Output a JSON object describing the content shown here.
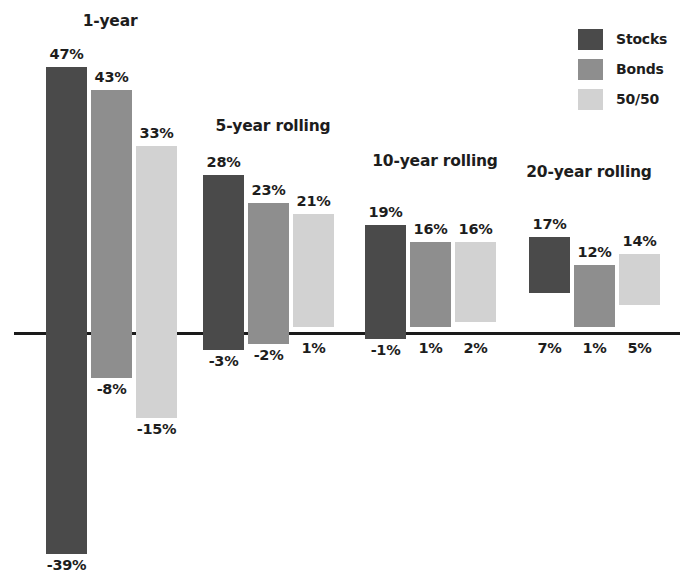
{
  "chart_data": {
    "type": "bar",
    "title": "",
    "subtitle": "",
    "xlabel": "",
    "ylabel": "",
    "orientation": "vertical",
    "grid": false,
    "legend_position": "top-right",
    "axis": {
      "zero_line": true,
      "ylim": [
        -42,
        50
      ],
      "units": "percent"
    },
    "categories": [
      "1-year",
      "5-year rolling",
      "10-year rolling",
      "20-year rolling"
    ],
    "series": [
      {
        "name": "Stocks",
        "color": "#4a4a4a",
        "high": [
          47,
          28,
          19,
          17
        ],
        "low": [
          -39,
          -3,
          -1,
          7
        ],
        "high_labels": [
          "47%",
          "28%",
          "19%",
          "17%"
        ],
        "low_labels": [
          "-39%",
          "-3%",
          "-1%",
          "7%"
        ]
      },
      {
        "name": "Bonds",
        "color": "#8e8e8e",
        "high": [
          43,
          23,
          16,
          12
        ],
        "low": [
          -8,
          -2,
          1,
          1
        ],
        "high_labels": [
          "43%",
          "23%",
          "16%",
          "12%"
        ],
        "low_labels": [
          "-8%",
          "-2%",
          "1%",
          "1%"
        ]
      },
      {
        "name": "50/50",
        "color": "#d2d2d2",
        "high": [
          33,
          21,
          16,
          14
        ],
        "low": [
          -15,
          1,
          2,
          5
        ],
        "high_labels": [
          "33%",
          "21%",
          "16%",
          "14%"
        ],
        "low_labels": [
          "-15%",
          "1%",
          "2%",
          "5%"
        ]
      }
    ]
  },
  "legend": {
    "items": [
      {
        "label": "Stocks",
        "color": "#4a4a4a"
      },
      {
        "label": "Bonds",
        "color": "#8e8e8e"
      },
      {
        "label": "50/50",
        "color": "#d2d2d2"
      }
    ]
  },
  "groups": [
    {
      "title": "1-year",
      "title_x": 110,
      "title_y": 12,
      "bars": [
        {
          "series": "Stocks",
          "x": 46,
          "top_label": "47%",
          "bottom_label": "-39%",
          "top_value": 47,
          "bottom_value": -39
        },
        {
          "series": "Bonds",
          "x": 91,
          "top_label": "43%",
          "bottom_label": "-8%",
          "top_value": 43,
          "bottom_value": -8
        },
        {
          "series": "50/50",
          "x": 136,
          "top_label": "33%",
          "bottom_label": "-15%",
          "top_value": 33,
          "bottom_value": -15
        }
      ]
    },
    {
      "title": "5-year rolling",
      "title_x": 273,
      "title_y": 117,
      "bars": [
        {
          "series": "Stocks",
          "x": 203,
          "top_label": "28%",
          "bottom_label": "-3%",
          "top_value": 28,
          "bottom_value": -3
        },
        {
          "series": "Bonds",
          "x": 248,
          "top_label": "23%",
          "bottom_label": "-2%",
          "top_value": 23,
          "bottom_value": -2
        },
        {
          "series": "50/50",
          "x": 293,
          "top_label": "21%",
          "bottom_label": "1%",
          "top_value": 21,
          "bottom_value": 1
        }
      ]
    },
    {
      "title": "10-year rolling",
      "title_x": 435,
      "title_y": 152,
      "bars": [
        {
          "series": "Stocks",
          "x": 365,
          "top_label": "19%",
          "bottom_label": "-1%",
          "top_value": 19,
          "bottom_value": -1
        },
        {
          "series": "Bonds",
          "x": 410,
          "top_label": "16%",
          "bottom_label": "1%",
          "top_value": 16,
          "bottom_value": 1
        },
        {
          "series": "50/50",
          "x": 455,
          "top_label": "16%",
          "bottom_label": "2%",
          "top_value": 16,
          "bottom_value": 2
        }
      ]
    },
    {
      "title": "20-year rolling",
      "title_x": 589,
      "title_y": 163,
      "bars": [
        {
          "series": "Stocks",
          "x": 529,
          "top_label": "17%",
          "bottom_label": "7%",
          "top_value": 17,
          "bottom_value": 7
        },
        {
          "series": "Bonds",
          "x": 574,
          "top_label": "12%",
          "bottom_label": "1%",
          "top_value": 12,
          "bottom_value": 1
        },
        {
          "series": "50/50",
          "x": 619,
          "top_label": "14%",
          "bottom_label": "5%",
          "top_value": 14,
          "bottom_value": 5
        }
      ]
    }
  ],
  "scale": {
    "zero_y": 333,
    "px_per_percent": 5.66,
    "bar_width": 41
  }
}
